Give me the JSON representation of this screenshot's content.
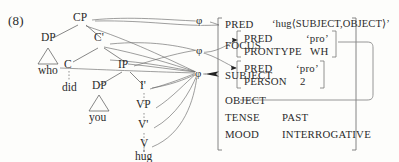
{
  "example_number": "(8)",
  "c_structure": {
    "nodes": [
      {
        "label": "CP"
      },
      {
        "label": "DP"
      },
      {
        "label": "C'"
      },
      {
        "label": "C"
      },
      {
        "label": "IP"
      },
      {
        "label": "DP"
      },
      {
        "label": "I'"
      },
      {
        "label": "VP"
      },
      {
        "label": "V'"
      },
      {
        "label": "V"
      }
    ],
    "terminals": [
      {
        "label": "who"
      },
      {
        "label": "did"
      },
      {
        "label": "you"
      },
      {
        "label": "hug"
      }
    ],
    "triangles": [
      "who",
      "you"
    ]
  },
  "correspondence": {
    "symbol": "φ",
    "count": 3,
    "labels": [
      "φ",
      "φ",
      "φ"
    ]
  },
  "f_structure": {
    "attributes": [
      {
        "name": "PRED",
        "value": "‘hug⟨SUBJECT,OBJECT⟩’"
      },
      {
        "name": "FOCUS",
        "value": ""
      },
      {
        "name": "SUBJECT",
        "value": ""
      },
      {
        "name": "OBJECT",
        "value": ""
      },
      {
        "name": "TENSE",
        "value": "PAST"
      },
      {
        "name": "MOOD",
        "value": "INTERROGATIVE"
      }
    ],
    "focus_avm": [
      {
        "name": "PRED",
        "value": "‘pro’"
      },
      {
        "name": "PRONTYPE",
        "value": "WH"
      }
    ],
    "subject_avm": [
      {
        "name": "PRED",
        "value": "‘pro’"
      },
      {
        "name": "PERSON",
        "value": "2"
      }
    ]
  },
  "colors": {
    "background": "#fdfdfb",
    "text": "#2b2b2b",
    "stroke": "#555555",
    "bracket": "#777777",
    "reentrancy": "#8a8a8a"
  }
}
